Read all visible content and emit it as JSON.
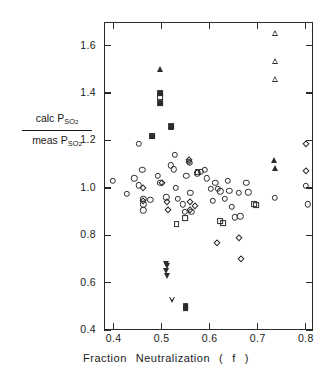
{
  "chart_data": {
    "type": "scatter",
    "title": "",
    "xlabel": "Fraction Neutralization ( f )",
    "ylabel_numerator": "calc P",
    "ylabel_numerator_sub": "SO2",
    "ylabel_denominator": "meas P",
    "ylabel_denominator_sub": "SO2",
    "xlim": [
      0.38,
      0.815
    ],
    "ylim": [
      0.4,
      1.7
    ],
    "xticks": [
      0.4,
      0.5,
      0.6,
      0.7,
      0.8
    ],
    "xticklabels": [
      "0.4",
      "0.5",
      "0.6",
      "0.7",
      "0.8"
    ],
    "yticks": [
      0.4,
      0.6,
      0.8,
      1.0,
      1.2,
      1.4,
      1.6
    ],
    "yticklabels": [
      "0.4",
      "0.6",
      "0.8",
      "1.0",
      "1.2",
      "1.4",
      "1.6"
    ],
    "grid": false,
    "legend": "none",
    "axis_color": "#2b2b2b",
    "marker_color": "#2b2b2b",
    "background": "#ffffff",
    "series": [
      {
        "name": "circle",
        "marker": "circle",
        "points": [
          [
            0.398,
            1.03
          ],
          [
            0.428,
            0.975
          ],
          [
            0.443,
            1.04
          ],
          [
            0.452,
            1.185
          ],
          [
            0.452,
            1.01
          ],
          [
            0.46,
            1.075
          ],
          [
            0.462,
            0.955
          ],
          [
            0.462,
            0.93
          ],
          [
            0.462,
            0.905
          ],
          [
            0.476,
            0.95
          ],
          [
            0.492,
            1.052
          ],
          [
            0.497,
            1.02
          ],
          [
            0.51,
            0.96
          ],
          [
            0.519,
            1.095
          ],
          [
            0.525,
            1.078
          ],
          [
            0.527,
            1.14
          ],
          [
            0.53,
            1.0
          ],
          [
            0.534,
            0.955
          ],
          [
            0.544,
            0.93
          ],
          [
            0.548,
            0.898
          ],
          [
            0.551,
            1.05
          ],
          [
            0.556,
            1.11
          ],
          [
            0.558,
            1.105
          ],
          [
            0.56,
            0.98
          ],
          [
            0.562,
            0.9
          ],
          [
            0.574,
            1.062
          ],
          [
            0.582,
            1.068
          ],
          [
            0.59,
            1.075
          ],
          [
            0.594,
            1.04
          ],
          [
            0.602,
            0.995
          ],
          [
            0.607,
            0.945
          ],
          [
            0.612,
            1.022
          ],
          [
            0.617,
            0.995
          ],
          [
            0.622,
            0.985
          ],
          [
            0.632,
            0.955
          ],
          [
            0.638,
            1.03
          ],
          [
            0.641,
            0.988
          ],
          [
            0.646,
            0.92
          ],
          [
            0.652,
            0.875
          ],
          [
            0.66,
            0.978
          ],
          [
            0.664,
            0.88
          ],
          [
            0.676,
            1.022
          ],
          [
            0.68,
            0.982
          ],
          [
            0.736,
            0.958
          ],
          [
            0.8,
            1.008
          ],
          [
            0.804,
            0.93
          ]
        ]
      },
      {
        "name": "diamond",
        "marker": "diamond",
        "points": [
          [
            0.462,
            1.0
          ],
          [
            0.462,
            0.945
          ],
          [
            0.5,
            1.022
          ],
          [
            0.511,
            0.94
          ],
          [
            0.513,
            0.905
          ],
          [
            0.556,
            1.118
          ],
          [
            0.558,
            0.94
          ],
          [
            0.56,
            0.905
          ],
          [
            0.57,
            0.925
          ],
          [
            0.616,
            0.768
          ],
          [
            0.66,
            0.79
          ],
          [
            0.666,
            0.7
          ],
          [
            0.8,
            1.185
          ],
          [
            0.8,
            1.072
          ]
        ]
      },
      {
        "name": "square-open",
        "marker": "square-open",
        "points": [
          [
            0.497,
            1.382
          ],
          [
            0.531,
            0.848
          ],
          [
            0.548,
            0.872
          ],
          [
            0.575,
            1.065
          ],
          [
            0.622,
            0.858
          ],
          [
            0.628,
            0.852
          ],
          [
            0.692,
            0.93
          ],
          [
            0.696,
            0.928
          ]
        ]
      },
      {
        "name": "square-filled",
        "marker": "square-filled",
        "points": [
          [
            0.48,
            1.218
          ],
          [
            0.497,
            1.4
          ],
          [
            0.497,
            1.358
          ],
          [
            0.519,
            1.262
          ],
          [
            0.55,
            0.502
          ],
          [
            0.55,
            0.492
          ]
        ]
      },
      {
        "name": "triangle-up-filled",
        "marker": "triangle-up-filled",
        "points": [
          [
            0.497,
            1.5
          ],
          [
            0.519,
            1.258
          ],
          [
            0.733,
            1.118
          ],
          [
            0.735,
            1.082
          ]
        ]
      },
      {
        "name": "triangle-up-open",
        "marker": "triangle-up-open",
        "points": [
          [
            0.736,
            1.652
          ],
          [
            0.736,
            1.56
          ],
          [
            0.736,
            1.508
          ]
        ]
      },
      {
        "name": "triangle-down-filled",
        "marker": "triangle-down-filled",
        "points": [
          [
            0.509,
            0.678
          ],
          [
            0.512,
            0.672
          ],
          [
            0.51,
            0.65
          ],
          [
            0.511,
            0.628
          ]
        ]
      },
      {
        "name": "triangle-down-open",
        "marker": "triangle-down-open",
        "points": [
          [
            0.522,
            0.602
          ]
        ]
      }
    ]
  }
}
